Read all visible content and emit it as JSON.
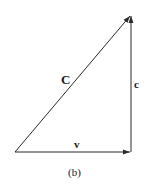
{
  "diagram": {
    "type": "vector-triangle",
    "vectors": [
      {
        "name": "C",
        "label": "C",
        "from": [
          15,
          152
        ],
        "to": [
          131,
          15
        ],
        "description": "hypotenuse"
      },
      {
        "name": "v",
        "label": "v",
        "from": [
          15,
          152
        ],
        "to": [
          131,
          152
        ],
        "description": "horizontal"
      },
      {
        "name": "c",
        "label": "c",
        "from": [
          131,
          152
        ],
        "to": [
          131,
          15
        ],
        "description": "vertical"
      }
    ],
    "caption": "(b)",
    "colors": {
      "stroke": "#2a2a2a",
      "text": "#1a1a1a",
      "background": "#ffffff"
    }
  }
}
